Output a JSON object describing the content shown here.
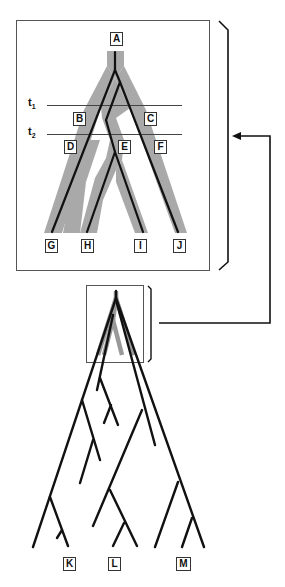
{
  "diagram": {
    "title": "",
    "inset_labels": {
      "root": "A",
      "internal": [
        "B",
        "C",
        "D",
        "E",
        "F"
      ],
      "tips": [
        "G",
        "H",
        "I",
        "J"
      ]
    },
    "time_lines": [
      {
        "label": "t",
        "sub": "1"
      },
      {
        "label": "t",
        "sub": "2"
      }
    ],
    "lower_tree_tips": [
      "K",
      "L",
      "M"
    ],
    "colors": {
      "species_tree_fill": "#a9a9a9",
      "gene_tree_line": "#111111",
      "frame": "#555555"
    }
  }
}
